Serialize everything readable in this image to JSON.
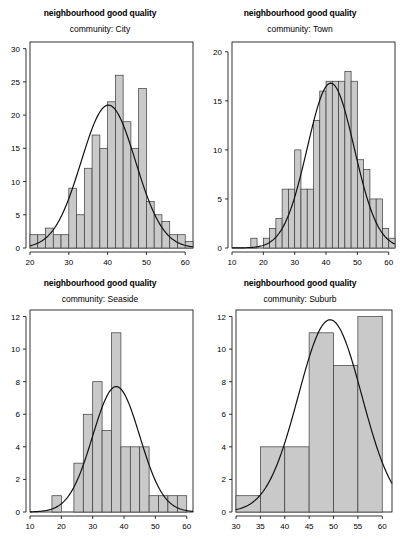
{
  "figure": {
    "panel_count": 4,
    "bar_fill_color": "#c9c9c9",
    "bar_border_color": "#3a3a3a",
    "curve_color": "#111111",
    "background_color": "#ffffff"
  },
  "chart_data": [
    {
      "type": "bar",
      "title": "neighbourhood good quality",
      "subtitle": "community: City",
      "xlabel": "",
      "ylabel": "",
      "xlim": [
        20,
        62
      ],
      "ylim": [
        0,
        31
      ],
      "xticks": [
        20,
        30,
        40,
        50,
        60
      ],
      "yticks": [
        0,
        5,
        10,
        15,
        20,
        25,
        30
      ],
      "grid": false,
      "legend": "none",
      "bin_width": 2,
      "bin_starts": [
        20,
        22,
        24,
        26,
        28,
        30,
        32,
        34,
        36,
        38,
        40,
        42,
        44,
        46,
        48,
        50,
        52,
        54,
        56,
        58,
        60
      ],
      "values": [
        2,
        2,
        3,
        2,
        2,
        9,
        5,
        12,
        17,
        15,
        22,
        26,
        19,
        15,
        24,
        7,
        5,
        4,
        2,
        2,
        1
      ],
      "overlay": {
        "name": "normal density curve",
        "mean": 40.2,
        "sd": 7.0,
        "peak_value": 21.5
      }
    },
    {
      "type": "bar",
      "title": "neighbourhood good quality",
      "subtitle": "community: Town",
      "xlabel": "",
      "ylabel": "",
      "xlim": [
        10,
        62
      ],
      "ylim": [
        0,
        21
      ],
      "xticks": [
        10,
        20,
        30,
        40,
        50,
        60
      ],
      "yticks": [
        0,
        5,
        10,
        15,
        20
      ],
      "grid": false,
      "legend": "none",
      "bin_width": 2,
      "bin_starts": [
        16,
        20,
        22,
        24,
        26,
        28,
        30,
        32,
        34,
        36,
        38,
        40,
        42,
        44,
        46,
        48,
        50,
        52,
        54,
        56,
        58,
        60
      ],
      "values": [
        1,
        1,
        2,
        3,
        6,
        6,
        10,
        6,
        6,
        13,
        16,
        17,
        17,
        17,
        18,
        17,
        9,
        8,
        5,
        5,
        2,
        1
      ],
      "overlay": {
        "name": "normal density curve",
        "mean": 41.5,
        "sd": 7.5,
        "peak_value": 16.8
      }
    },
    {
      "type": "bar",
      "title": "neighbourhood good quality",
      "subtitle": "community: Seaside",
      "xlabel": "",
      "ylabel": "",
      "xlim": [
        10,
        62
      ],
      "ylim": [
        0,
        12.4
      ],
      "xticks": [
        10,
        20,
        30,
        40,
        50,
        60
      ],
      "yticks": [
        0,
        2,
        4,
        6,
        8,
        10,
        12
      ],
      "grid": false,
      "legend": "none",
      "bin_width": 3,
      "bin_starts": [
        17,
        20,
        24,
        27,
        30,
        33,
        36,
        39,
        42,
        45,
        48,
        51,
        54,
        57
      ],
      "values": [
        1,
        0,
        3,
        6,
        8,
        5,
        11,
        4,
        4,
        4,
        1,
        1,
        1,
        1
      ],
      "overlay": {
        "name": "normal density curve",
        "mean": 37.5,
        "sd": 7.5,
        "peak_value": 7.7
      }
    },
    {
      "type": "bar",
      "title": "neighbourhood good quality",
      "subtitle": "community: Suburb",
      "xlabel": "",
      "ylabel": "",
      "xlim": [
        30,
        62
      ],
      "ylim": [
        0,
        12.4
      ],
      "xticks": [
        30,
        35,
        40,
        45,
        50,
        55,
        60
      ],
      "yticks": [
        0,
        2,
        4,
        6,
        8,
        10,
        12
      ],
      "grid": false,
      "legend": "none",
      "bin_width": 5,
      "bin_starts": [
        30,
        35,
        40,
        45,
        50,
        55
      ],
      "values": [
        1,
        4,
        4,
        11,
        9,
        12
      ],
      "overlay": {
        "name": "normal density curve",
        "mean": 49.3,
        "sd": 6.5,
        "peak_value": 11.8
      }
    }
  ]
}
